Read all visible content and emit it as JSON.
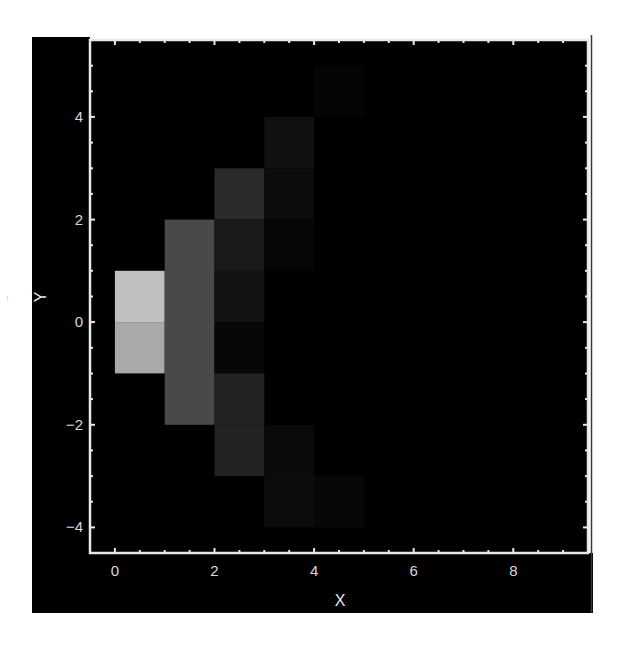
{
  "chart_data": {
    "type": "heatmap",
    "title": "",
    "xlabel": "X",
    "ylabel": "Y",
    "xlim": [
      -0.5,
      9.5
    ],
    "ylim": [
      -4.5,
      5.5
    ],
    "x_ticks": [
      0,
      2,
      4,
      6,
      8
    ],
    "y_ticks": [
      -4,
      -2,
      0,
      2,
      4
    ],
    "x_tick_labels": [
      "0",
      "2",
      "4",
      "6",
      "8"
    ],
    "y_tick_labels": [
      "−4",
      "−2",
      "0",
      "2",
      "4"
    ],
    "minor_tick_step": 0.5,
    "grid": false,
    "legend": null,
    "colormap": "grayscale (black = 0, white = max)",
    "background_color": "#000000",
    "axis_color": "#e8e8e8",
    "cells": [
      {
        "x0": 0,
        "x1": 1,
        "y0": 0,
        "y1": 1,
        "intensity": 0.75,
        "color": "#c0c0c0"
      },
      {
        "x0": 0,
        "x1": 1,
        "y0": -1,
        "y1": 0,
        "intensity": 0.66,
        "color": "#a9a9a9"
      },
      {
        "x0": 1,
        "x1": 2,
        "y0": -2,
        "y1": 2,
        "intensity": 0.29,
        "color": "#494949"
      },
      {
        "x0": 2,
        "x1": 3,
        "y0": 2,
        "y1": 3,
        "intensity": 0.17,
        "color": "#2b2b2b"
      },
      {
        "x0": 2,
        "x1": 3,
        "y0": 1,
        "y1": 2,
        "intensity": 0.1,
        "color": "#1a1a1a"
      },
      {
        "x0": 2,
        "x1": 3,
        "y0": 0,
        "y1": 1,
        "intensity": 0.075,
        "color": "#131313"
      },
      {
        "x0": 2,
        "x1": 3,
        "y0": -1,
        "y1": 0,
        "intensity": 0.03,
        "color": "#070707"
      },
      {
        "x0": 2,
        "x1": 3,
        "y0": -2,
        "y1": -1,
        "intensity": 0.14,
        "color": "#232323"
      },
      {
        "x0": 2,
        "x1": 3,
        "y0": -3,
        "y1": -2,
        "intensity": 0.13,
        "color": "#222222"
      },
      {
        "x0": 3,
        "x1": 4,
        "y0": 3,
        "y1": 4,
        "intensity": 0.06,
        "color": "#101010"
      },
      {
        "x0": 3,
        "x1": 4,
        "y0": 2,
        "y1": 3,
        "intensity": 0.05,
        "color": "#0c0c0c"
      },
      {
        "x0": 3,
        "x1": 4,
        "y0": 1,
        "y1": 2,
        "intensity": 0.02,
        "color": "#060606"
      },
      {
        "x0": 3,
        "x1": 4,
        "y0": -3,
        "y1": -2,
        "intensity": 0.04,
        "color": "#0a0a0a"
      },
      {
        "x0": 3,
        "x1": 4,
        "y0": -4,
        "y1": -3,
        "intensity": 0.05,
        "color": "#0c0c0c"
      },
      {
        "x0": 4,
        "x1": 5,
        "y0": -4,
        "y1": -3,
        "intensity": 0.03,
        "color": "#070707"
      },
      {
        "x0": 4,
        "x1": 5,
        "y0": 4,
        "y1": 5,
        "intensity": 0.02,
        "color": "#050505"
      }
    ]
  },
  "margin_artifact": "⁝"
}
